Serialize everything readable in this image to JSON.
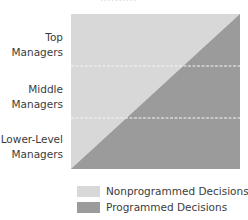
{
  "diagram": {
    "top_stub_text": "..........",
    "levels": [
      {
        "line1": "Top",
        "line2": "Managers"
      },
      {
        "line1": "Middle",
        "line2": "Managers"
      },
      {
        "line1": "Lower-Level",
        "line2": "Managers"
      }
    ],
    "legend": [
      {
        "label": "Nonprogrammed Decisions",
        "color": "#d8d8d8"
      },
      {
        "label": "Programmed Decisions",
        "color": "#9b9b9b"
      }
    ],
    "colors": {
      "nonprogrammed": "#d8d8d8",
      "programmed": "#9b9b9b",
      "divider": "#f2f2f2",
      "text": "#3c3c3c"
    }
  }
}
